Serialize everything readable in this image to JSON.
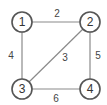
{
  "graph": {
    "nodes": [
      {
        "id": "1",
        "label": "1",
        "x": 22,
        "y": 22
      },
      {
        "id": "2",
        "label": "2",
        "x": 90,
        "y": 22
      },
      {
        "id": "3",
        "label": "3",
        "x": 22,
        "y": 89
      },
      {
        "id": "4",
        "label": "4",
        "x": 90,
        "y": 89
      }
    ],
    "edges": [
      {
        "from": "1",
        "to": "2",
        "weight": "2"
      },
      {
        "from": "1",
        "to": "3",
        "weight": "4"
      },
      {
        "from": "2",
        "to": "3",
        "weight": "3"
      },
      {
        "from": "2",
        "to": "4",
        "weight": "5"
      },
      {
        "from": "3",
        "to": "4",
        "weight": "6"
      }
    ],
    "colors": {
      "edge": "#8a8a8a",
      "node_stroke": "#555555",
      "background": "#ffffff"
    }
  }
}
